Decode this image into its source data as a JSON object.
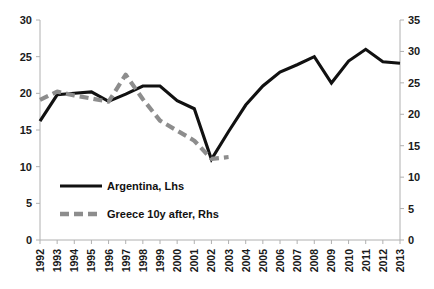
{
  "chart_data": {
    "type": "line",
    "title": "",
    "xlabel": "",
    "ylabel": "",
    "grid": false,
    "legend_position": "inside-bottom-left",
    "x": [
      1992,
      1993,
      1994,
      1995,
      1996,
      1997,
      1998,
      1999,
      2000,
      2001,
      2002,
      2003,
      2004,
      2005,
      2006,
      2007,
      2008,
      2009,
      2010,
      2011,
      2012,
      2013
    ],
    "xtick_labels": [
      "1992",
      "1993",
      "1994",
      "1995",
      "1996",
      "1997",
      "1998",
      "1999",
      "2000",
      "2001",
      "2002",
      "2003",
      "2004",
      "2005",
      "2006",
      "2007",
      "2008",
      "2009",
      "2010",
      "2011",
      "2012",
      "2013"
    ],
    "left_axis": {
      "label": "",
      "ylim": [
        0,
        30
      ],
      "ticks": [
        0,
        5,
        10,
        15,
        20,
        25,
        30
      ],
      "tick_labels": [
        "0",
        "5",
        "10",
        "15",
        "20",
        "25",
        "30"
      ]
    },
    "right_axis": {
      "label": "",
      "ylim": [
        0,
        35
      ],
      "ticks": [
        0,
        5,
        10,
        15,
        20,
        25,
        30,
        35
      ],
      "tick_labels": [
        "0",
        "5",
        "10",
        "15",
        "20",
        "25",
        "30",
        "35"
      ]
    },
    "series": [
      {
        "name": "Argentina, Lhs",
        "axis": "left",
        "style": "solid",
        "color": "#111111",
        "x": [
          1992,
          1993,
          1994,
          1995,
          1996,
          1997,
          1998,
          1999,
          2000,
          2001,
          2002,
          2003,
          2004,
          2005,
          2006,
          2007,
          2008,
          2009,
          2010,
          2011,
          2012,
          2013
        ],
        "values": [
          16.2,
          19.8,
          20.0,
          20.2,
          18.9,
          19.9,
          21.0,
          21.0,
          19.0,
          17.9,
          11.0,
          14.8,
          18.4,
          21.0,
          22.9,
          23.9,
          25.0,
          21.4,
          24.4,
          26.0,
          24.3,
          24.1
        ]
      },
      {
        "name": "Greece 10y after, Rhs",
        "axis": "right",
        "style": "dashed",
        "color": "#8d8d8d",
        "x": [
          1992,
          1993,
          1994,
          1995,
          1996,
          1997,
          1998,
          1999,
          2000,
          2001,
          2002,
          2003
        ],
        "values": [
          22.3,
          23.6,
          23.0,
          22.5,
          22.0,
          26.3,
          22.4,
          19.0,
          17.4,
          15.8,
          12.9,
          13.2
        ]
      }
    ],
    "legend": [
      {
        "label": "Argentina, Lhs",
        "style": "solid",
        "color": "#111111"
      },
      {
        "label": "Greece 10y after, Rhs",
        "style": "dashed",
        "color": "#8d8d8d"
      }
    ]
  }
}
